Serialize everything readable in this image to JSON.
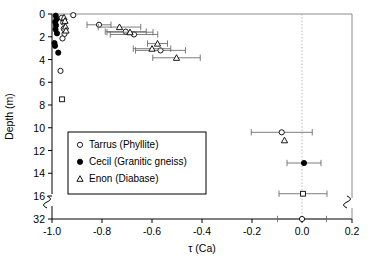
{
  "chart_data": {
    "type": "scatter",
    "title": "",
    "xlabel": "τ (Ca)",
    "ylabel": "Depth (m)",
    "xlim": [
      -1.0,
      0.2
    ],
    "ylim": [
      0,
      32
    ],
    "grid": false,
    "legend_position": "center-left",
    "xticks": [
      -1.0,
      -0.8,
      -0.6,
      -0.4,
      -0.2,
      0.0,
      0.2
    ],
    "xticklabels": [
      "-1.0",
      "-0.8",
      "-0.6",
      "-0.4",
      "-0.2",
      "0.0",
      "0.2"
    ],
    "yticks": [
      0,
      2,
      4,
      6,
      8,
      10,
      12,
      14,
      16,
      32
    ],
    "yticklabels": [
      "0",
      "2",
      "4",
      "6",
      "8",
      "10",
      "12",
      "14",
      "16",
      "32"
    ],
    "y_axis_break": {
      "after": 16,
      "before": 32,
      "label": "axis-break"
    },
    "x_axis_break": {
      "near": 0.2,
      "label": "axis-break"
    },
    "reference_line_x": 0.0,
    "series": [
      {
        "name": "Tarrus (Phyllite)",
        "marker": "open-circle",
        "color": "#000000",
        "points": [
          {
            "x": -0.915,
            "y": 0.1
          },
          {
            "x": -0.962,
            "y": 0.35
          },
          {
            "x": -0.955,
            "y": 0.75
          },
          {
            "x": -0.953,
            "y": 1.3
          },
          {
            "x": -0.95,
            "y": 1.75
          },
          {
            "x": -0.958,
            "y": 2.15
          },
          {
            "x": -0.966,
            "y": 5.0
          },
          {
            "x": -0.812,
            "y": 0.95,
            "xerr": [
              0.048,
              0.048
            ]
          },
          {
            "x": -0.705,
            "y": 1.55,
            "xerr": [
              0.082,
              0.082
            ]
          },
          {
            "x": -0.672,
            "y": 1.8,
            "xerr": [
              0.095,
              0.095
            ]
          },
          {
            "x": -0.566,
            "y": 3.2,
            "xerr": [
              0.1,
              0.1
            ]
          },
          {
            "x": -0.081,
            "y": 10.4,
            "xerr": [
              0.122,
              0.122
            ]
          },
          {
            "x": 0.0,
            "y": 32.0,
            "xerr": [
              0.098,
              0.098
            ]
          }
        ]
      },
      {
        "name": "Cecil (Granitic gneiss)",
        "marker": "filled-circle",
        "color": "#000000",
        "points": [
          {
            "x": -0.985,
            "y": 0.15
          },
          {
            "x": -0.982,
            "y": 0.45
          },
          {
            "x": -0.987,
            "y": 0.7
          },
          {
            "x": -0.984,
            "y": 1.0
          },
          {
            "x": -0.986,
            "y": 1.35
          },
          {
            "x": -0.98,
            "y": 1.7
          },
          {
            "x": -0.99,
            "y": 2.55
          },
          {
            "x": -0.988,
            "y": 2.8
          },
          {
            "x": -0.975,
            "y": 3.4
          },
          {
            "x": 0.008,
            "y": 13.1,
            "xerr": [
              0.068,
              0.068
            ]
          }
        ]
      },
      {
        "name": "Enon (Diabase)",
        "marker": "open-triangle",
        "color": "#000000",
        "points": [
          {
            "x": -0.952,
            "y": 0.3
          },
          {
            "x": -0.948,
            "y": 0.6
          },
          {
            "x": -0.946,
            "y": 1.1
          },
          {
            "x": -0.944,
            "y": 1.45
          },
          {
            "x": -0.73,
            "y": 1.15,
            "xerr": [
              0.085,
              0.085
            ]
          },
          {
            "x": -0.688,
            "y": 1.6,
            "xerr": [
              0.092,
              0.092
            ]
          },
          {
            "x": -0.578,
            "y": 2.6,
            "xerr": [
              0.04,
              0.04
            ]
          },
          {
            "x": -0.6,
            "y": 3.05,
            "xerr": [
              0.075,
              0.075
            ]
          },
          {
            "x": -0.502,
            "y": 3.85,
            "xerr": [
              0.095,
              0.095
            ]
          },
          {
            "x": -0.07,
            "y": 11.1
          }
        ]
      },
      {
        "name": "unlabeled-square",
        "marker": "open-square",
        "color": "#000000",
        "points": [
          {
            "x": -0.96,
            "y": 7.5
          },
          {
            "x": 0.004,
            "y": 15.8,
            "xerr": [
              0.096,
              0.096
            ]
          }
        ]
      }
    ],
    "legend": [
      {
        "label": "Tarrus (Phyllite)",
        "marker": "open-circle"
      },
      {
        "label": "Cecil (Granitic gneiss)",
        "marker": "filled-circle"
      },
      {
        "label": "Enon (Diabase)",
        "marker": "open-triangle"
      }
    ]
  }
}
